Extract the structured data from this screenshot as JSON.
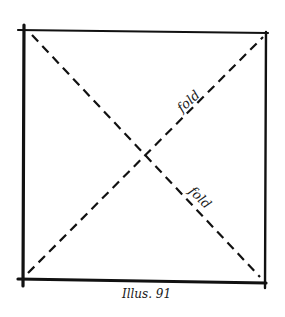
{
  "figure": {
    "caption": "Illus. 91",
    "shape": "square",
    "labels": {
      "upper_fold": "fold",
      "lower_fold": "fold"
    },
    "colors": {
      "ink": "#111111",
      "paper": "#ffffff"
    },
    "fold_lines": [
      {
        "name": "diagonal-top-left-to-bottom-right",
        "style": "dashed"
      },
      {
        "name": "diagonal-bottom-left-to-top-right",
        "style": "dashed"
      }
    ]
  }
}
